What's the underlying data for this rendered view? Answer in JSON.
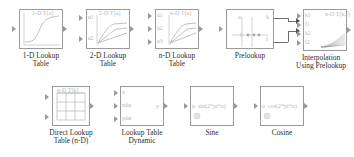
{
  "diagram": {
    "background": "#ffffff",
    "line_color": "#9a9a9a",
    "label_color": "#2e2e2e",
    "inner_text_color": "#b9b9b9"
  },
  "blocks": [
    {
      "id": "lookup-1d",
      "caption": "1-D Lookup\nTable",
      "inner_label": "1-D T(u)",
      "inputs": [],
      "outputs": [],
      "icon": "sigmoid-curve"
    },
    {
      "id": "lookup-2d",
      "caption": "2-D Lookup\nTable",
      "inner_label": "2-D T(u)",
      "inputs": [
        "u1",
        "u2"
      ],
      "outputs": [],
      "icon": "surface-curves"
    },
    {
      "id": "lookup-nd",
      "caption": "n-D Lookup\nTable",
      "inner_label": "n-D T(u)",
      "inputs": [
        "u1",
        "u2",
        "u3"
      ],
      "outputs": [],
      "icon": "surface-curves"
    },
    {
      "id": "prelookup",
      "caption": "Prelookup",
      "inner_label": "",
      "inputs": [
        "u"
      ],
      "outputs": [
        "k",
        "f"
      ],
      "icon": "breakpoint-axis"
    },
    {
      "id": "interpolation-using-prelookup",
      "caption": "Interpolation\nUsing Prelookup",
      "inner_label": "n-D\nT(k,f)",
      "inputs": [
        "k1",
        "f1",
        "k2",
        "f2"
      ],
      "outputs": [],
      "icon": "fan-curves"
    },
    {
      "id": "direct-lookup-nd",
      "caption": "Direct Lookup\nTable (n-D)",
      "inner_label": "n-D T[k]",
      "inputs": [],
      "outputs": [],
      "icon": "grid-table"
    },
    {
      "id": "lookup-table-dynamic",
      "caption": "Lookup Table\nDynamic",
      "inner_label": "",
      "inputs": [
        "x",
        "xdat",
        "ydat"
      ],
      "outputs": [
        "y"
      ],
      "icon": "none"
    },
    {
      "id": "sine",
      "caption": "Sine",
      "inner_label": "sin(2*pi*u)",
      "inputs": [
        "u"
      ],
      "outputs": [],
      "icon": "sine-mark"
    },
    {
      "id": "cosine",
      "caption": "Cosine",
      "inner_label": "cos(2*pi*u)",
      "inputs": [
        "u"
      ],
      "outputs": [],
      "icon": "sine-mark"
    }
  ]
}
